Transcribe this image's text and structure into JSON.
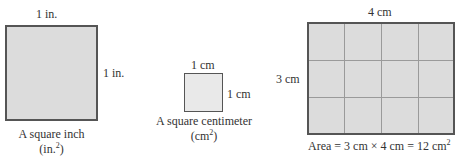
{
  "figures": [
    {
      "id": "square-inch",
      "top_label": "1 in.",
      "side_label": "1 in.",
      "caption_line1": "A square inch",
      "caption_line2_prefix": "(in.",
      "caption_line2_sup": "2",
      "caption_line2_suffix": ")"
    },
    {
      "id": "square-centimeter",
      "top_label": "1 cm",
      "side_label": "1 cm",
      "caption_line1": "A square centimeter",
      "caption_line2_prefix": "(cm",
      "caption_line2_sup": "2",
      "caption_line2_suffix": ")"
    },
    {
      "id": "rectangle-grid",
      "top_label": "4 cm",
      "side_label": "3 cm",
      "rows": 3,
      "columns": 4,
      "caption_prefix": "Area = 3 cm × 4 cm = 12 cm",
      "caption_sup": "2"
    }
  ],
  "colors": {
    "fill": "#dcdcdc",
    "border": "#555555",
    "gridline": "#9a9a9a"
  }
}
